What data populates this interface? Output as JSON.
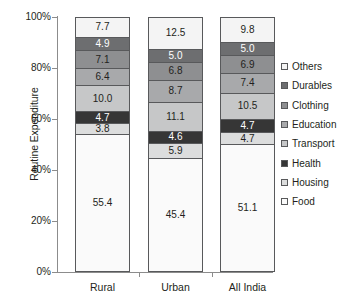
{
  "chart_data": {
    "type": "bar",
    "subtype": "stacked-percentage",
    "title": "",
    "xlabel": "",
    "ylabel": "Routine Expenditure",
    "categories": [
      "Rural",
      "Urban",
      "All India"
    ],
    "ylim": [
      0,
      100
    ],
    "ytick_labels": [
      "0%",
      "20%",
      "40%",
      "60%",
      "80%",
      "100%"
    ],
    "ytick_values": [
      0,
      20,
      40,
      60,
      80,
      100
    ],
    "grid": false,
    "legend_position": "right",
    "stack_order_bottom_to_top": [
      "Food",
      "Housing",
      "Health",
      "Transport",
      "Education",
      "Clothing",
      "Durables",
      "Others"
    ],
    "legend_order_top_to_bottom": [
      "Others",
      "Durables",
      "Clothing",
      "Education",
      "Transport",
      "Health",
      "Housing",
      "Food"
    ],
    "series": [
      {
        "name": "Others",
        "color": "#f4f4f4",
        "values": [
          7.7,
          12.5,
          9.8
        ]
      },
      {
        "name": "Durables",
        "color": "#6d6e70",
        "values": [
          4.9,
          5.0,
          5.0
        ]
      },
      {
        "name": "Clothing",
        "color": "#8e8f91",
        "values": [
          7.1,
          6.8,
          6.9
        ]
      },
      {
        "name": "Education",
        "color": "#a8a9ab",
        "values": [
          6.4,
          8.7,
          7.4
        ]
      },
      {
        "name": "Transport",
        "color": "#c6c7c8",
        "values": [
          10.0,
          11.1,
          10.5
        ]
      },
      {
        "name": "Health",
        "color": "#363636",
        "values": [
          4.7,
          4.6,
          4.7
        ]
      },
      {
        "name": "Housing",
        "color": "#dcdddd",
        "values": [
          3.8,
          5.9,
          4.7
        ]
      },
      {
        "name": "Food",
        "color": "#fafafa",
        "values": [
          55.4,
          45.4,
          51.1
        ]
      }
    ]
  },
  "axis": {
    "y_title": "Routine Expenditure",
    "y_ticks": [
      "100%",
      "80%",
      "60%",
      "40%",
      "20%",
      "0%"
    ],
    "x_categories": [
      "Rural",
      "Urban",
      "All India"
    ]
  },
  "legend": {
    "items": [
      {
        "label": "Others",
        "color": "#f4f4f4"
      },
      {
        "label": "Durables",
        "color": "#6d6e70"
      },
      {
        "label": "Clothing",
        "color": "#8e8f91"
      },
      {
        "label": "Education",
        "color": "#a8a9ab"
      },
      {
        "label": "Transport",
        "color": "#c6c7c8"
      },
      {
        "label": "Health",
        "color": "#363636"
      },
      {
        "label": "Housing",
        "color": "#dcdddd"
      },
      {
        "label": "Food",
        "color": "#fafafa"
      }
    ]
  },
  "bars": [
    {
      "category": "Rural",
      "segments_top_to_bottom": [
        {
          "name": "Others",
          "value": "7.7",
          "color": "#f4f4f4",
          "text": "#231f20"
        },
        {
          "name": "Durables",
          "value": "4.9",
          "color": "#6d6e70",
          "text": "#ffffff"
        },
        {
          "name": "Clothing",
          "value": "7.1",
          "color": "#8e8f91",
          "text": "#231f20"
        },
        {
          "name": "Education",
          "value": "6.4",
          "color": "#a8a9ab",
          "text": "#231f20"
        },
        {
          "name": "Transport",
          "value": "10.0",
          "color": "#c6c7c8",
          "text": "#231f20"
        },
        {
          "name": "Health",
          "value": "4.7",
          "color": "#363636",
          "text": "#ffffff"
        },
        {
          "name": "Housing",
          "value": "3.8",
          "color": "#dcdddd",
          "text": "#231f20"
        },
        {
          "name": "Food",
          "value": "55.4",
          "color": "#fafafa",
          "text": "#231f20"
        }
      ]
    },
    {
      "category": "Urban",
      "segments_top_to_bottom": [
        {
          "name": "Others",
          "value": "12.5",
          "color": "#f4f4f4",
          "text": "#231f20"
        },
        {
          "name": "Durables",
          "value": "5.0",
          "color": "#6d6e70",
          "text": "#ffffff"
        },
        {
          "name": "Clothing",
          "value": "6.8",
          "color": "#8e8f91",
          "text": "#231f20"
        },
        {
          "name": "Education",
          "value": "8.7",
          "color": "#a8a9ab",
          "text": "#231f20"
        },
        {
          "name": "Transport",
          "value": "11.1",
          "color": "#c6c7c8",
          "text": "#231f20"
        },
        {
          "name": "Health",
          "value": "4.6",
          "color": "#363636",
          "text": "#ffffff"
        },
        {
          "name": "Housing",
          "value": "5.9",
          "color": "#dcdddd",
          "text": "#231f20"
        },
        {
          "name": "Food",
          "value": "45.4",
          "color": "#fafafa",
          "text": "#231f20"
        }
      ]
    },
    {
      "category": "All India",
      "segments_top_to_bottom": [
        {
          "name": "Others",
          "value": "9.8",
          "color": "#f4f4f4",
          "text": "#231f20"
        },
        {
          "name": "Durables",
          "value": "5.0",
          "color": "#6d6e70",
          "text": "#ffffff"
        },
        {
          "name": "Clothing",
          "value": "6.9",
          "color": "#8e8f91",
          "text": "#231f20"
        },
        {
          "name": "Education",
          "value": "7.4",
          "color": "#a8a9ab",
          "text": "#231f20"
        },
        {
          "name": "Transport",
          "value": "10.5",
          "color": "#c6c7c8",
          "text": "#231f20"
        },
        {
          "name": "Health",
          "value": "4.7",
          "color": "#363636",
          "text": "#ffffff"
        },
        {
          "name": "Housing",
          "value": "4.7",
          "color": "#dcdddd",
          "text": "#231f20"
        },
        {
          "name": "Food",
          "value": "51.1",
          "color": "#fafafa",
          "text": "#231f20"
        }
      ]
    }
  ]
}
